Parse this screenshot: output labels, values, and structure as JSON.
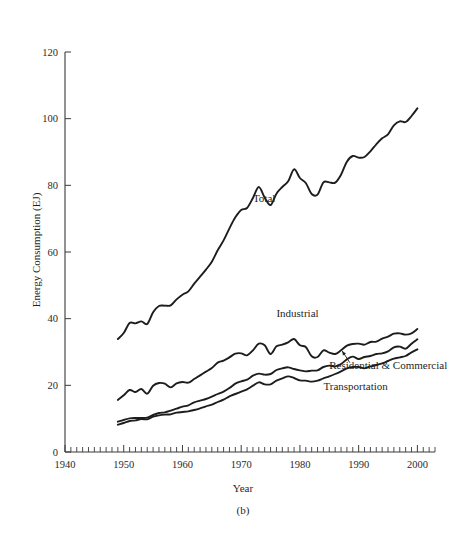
{
  "figure": {
    "caption": "(b)",
    "background_color": "#ffffff",
    "line_color": "#1d1d1d",
    "axis_color": "#3a3a3a"
  },
  "chart_data": {
    "type": "line",
    "title": "",
    "xlabel": "Year",
    "ylabel": "Energy Consumption (EJ)",
    "xlim": [
      1940,
      2003
    ],
    "ylim": [
      0,
      120
    ],
    "yticks": [
      0,
      20,
      40,
      60,
      80,
      100,
      120
    ],
    "xticks": [
      1940,
      1950,
      1960,
      1970,
      1980,
      1990,
      2000
    ],
    "x_minor_tick_step": 1,
    "grid": false,
    "legend": "inline-labels",
    "series": [
      {
        "name": "Total",
        "label_x": 1972,
        "label_y": 75,
        "x": [
          1949,
          1950,
          1951,
          1952,
          1953,
          1954,
          1955,
          1956,
          1957,
          1958,
          1959,
          1960,
          1961,
          1962,
          1963,
          1964,
          1965,
          1966,
          1967,
          1968,
          1969,
          1970,
          1971,
          1972,
          1973,
          1974,
          1975,
          1976,
          1977,
          1978,
          1979,
          1980,
          1981,
          1982,
          1983,
          1984,
          1985,
          1986,
          1987,
          1988,
          1989,
          1990,
          1991,
          1992,
          1993,
          1994,
          1995,
          1996,
          1997,
          1998,
          1999,
          2000
        ],
        "values": [
          33.9,
          35.7,
          38.7,
          38.6,
          39.2,
          38.4,
          41.9,
          43.8,
          43.9,
          44.0,
          45.8,
          47.2,
          48.2,
          50.5,
          52.6,
          54.7,
          57.1,
          60.5,
          63.5,
          67.1,
          70.4,
          72.6,
          73.2,
          76.2,
          79.5,
          76.3,
          74.1,
          77.5,
          79.5,
          81.2,
          84.8,
          82.2,
          80.7,
          77.4,
          77.2,
          80.9,
          80.9,
          80.8,
          83.2,
          87.1,
          88.8,
          88.3,
          88.5,
          90.2,
          92.3,
          94.1,
          95.3,
          98.0,
          99.2,
          99.0,
          100.8,
          103.1
        ]
      },
      {
        "name": "Industrial",
        "label_x": 1976,
        "label_y": 40.5,
        "x": [
          1949,
          1950,
          1951,
          1952,
          1953,
          1954,
          1955,
          1956,
          1957,
          1958,
          1959,
          1960,
          1961,
          1962,
          1963,
          1964,
          1965,
          1966,
          1967,
          1968,
          1969,
          1970,
          1971,
          1972,
          1973,
          1974,
          1975,
          1976,
          1977,
          1978,
          1979,
          1980,
          1981,
          1982,
          1983,
          1984,
          1985,
          1986,
          1987,
          1988,
          1989,
          1990,
          1991,
          1992,
          1993,
          1994,
          1995,
          1996,
          1997,
          1998,
          1999,
          2000
        ],
        "values": [
          15.6,
          17.0,
          18.6,
          18.0,
          18.9,
          17.5,
          19.9,
          20.7,
          20.5,
          19.4,
          20.6,
          21.0,
          20.8,
          21.9,
          23.0,
          24.1,
          25.2,
          26.8,
          27.4,
          28.4,
          29.5,
          29.6,
          29.0,
          30.5,
          32.5,
          32.0,
          29.4,
          31.7,
          32.2,
          32.9,
          33.9,
          32.0,
          31.5,
          28.7,
          28.5,
          30.5,
          29.8,
          29.4,
          30.5,
          31.9,
          32.4,
          32.5,
          32.2,
          33.0,
          33.1,
          34.0,
          34.6,
          35.5,
          35.6,
          35.2,
          35.6,
          36.9
        ]
      },
      {
        "name": "Residential & Commercial",
        "label_x": 1985,
        "label_y": 25.0,
        "leader_from": [
          1988.5,
          26.8
        ],
        "leader_to": [
          1987.2,
          30.3
        ],
        "x": [
          1949,
          1950,
          1951,
          1952,
          1953,
          1954,
          1955,
          1956,
          1957,
          1958,
          1959,
          1960,
          1961,
          1962,
          1963,
          1964,
          1965,
          1966,
          1967,
          1968,
          1969,
          1970,
          1971,
          1972,
          1973,
          1974,
          1975,
          1976,
          1977,
          1978,
          1979,
          1980,
          1981,
          1982,
          1983,
          1984,
          1985,
          1986,
          1987,
          1988,
          1989,
          1990,
          1991,
          1992,
          1993,
          1994,
          1995,
          1996,
          1997,
          1998,
          1999,
          2000
        ],
        "values": [
          9.1,
          9.6,
          10.1,
          10.2,
          10.2,
          10.3,
          11.1,
          11.7,
          11.9,
          12.4,
          13.0,
          13.6,
          14.0,
          14.9,
          15.4,
          15.9,
          16.6,
          17.4,
          18.1,
          19.2,
          20.5,
          21.2,
          21.7,
          22.9,
          23.5,
          23.2,
          23.4,
          24.6,
          25.1,
          25.4,
          24.9,
          24.5,
          24.2,
          24.4,
          24.5,
          25.5,
          25.9,
          25.7,
          26.4,
          27.8,
          28.6,
          27.9,
          28.5,
          28.8,
          29.4,
          29.6,
          30.2,
          31.4,
          31.6,
          31.0,
          32.5,
          33.8
        ]
      },
      {
        "name": "Transportation",
        "label_x": 1984,
        "label_y": 18.5,
        "x": [
          1949,
          1950,
          1951,
          1952,
          1953,
          1954,
          1955,
          1956,
          1957,
          1958,
          1959,
          1960,
          1961,
          1962,
          1963,
          1964,
          1965,
          1966,
          1967,
          1968,
          1969,
          1970,
          1971,
          1972,
          1973,
          1974,
          1975,
          1976,
          1977,
          1978,
          1979,
          1980,
          1981,
          1982,
          1983,
          1984,
          1985,
          1986,
          1987,
          1988,
          1989,
          1990,
          1991,
          1992,
          1993,
          1994,
          1995,
          1996,
          1997,
          1998,
          1999,
          2000
        ],
        "values": [
          8.2,
          8.7,
          9.3,
          9.5,
          9.9,
          9.8,
          10.6,
          11.0,
          11.2,
          11.3,
          11.8,
          12.0,
          12.2,
          12.6,
          13.1,
          13.7,
          14.2,
          15.0,
          15.7,
          16.7,
          17.4,
          18.1,
          18.8,
          19.9,
          20.9,
          20.3,
          20.3,
          21.4,
          22.1,
          22.7,
          22.2,
          21.5,
          21.4,
          21.1,
          21.4,
          22.1,
          22.7,
          23.4,
          24.2,
          25.1,
          25.5,
          25.5,
          25.1,
          25.7,
          26.1,
          26.6,
          27.3,
          28.0,
          28.4,
          28.8,
          29.9,
          30.8
        ]
      }
    ]
  }
}
